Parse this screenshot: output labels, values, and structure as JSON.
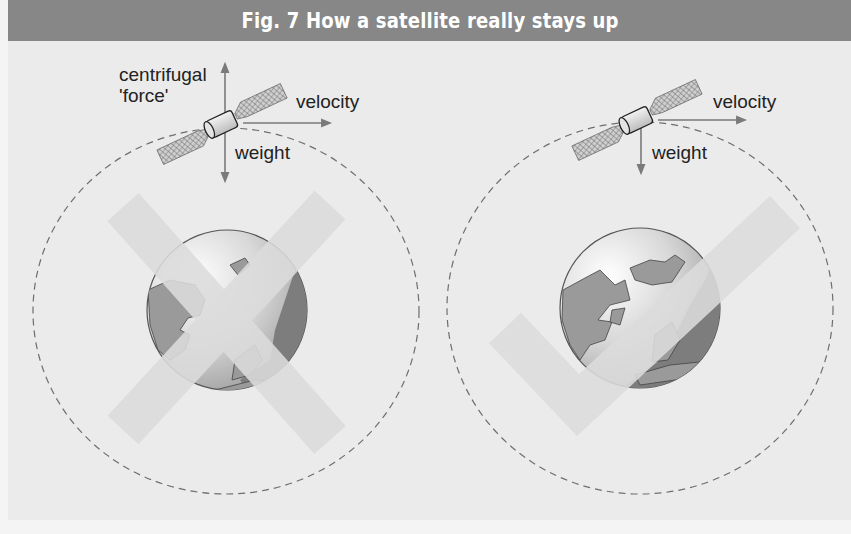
{
  "figure": {
    "title": "Fig. 7 How a satellite really stays up",
    "colors": {
      "header_bg": "#878787",
      "panel_bg": "#ebebeb",
      "mark_color": "#dcdcdc",
      "globe_land": "#9a9a9a",
      "globe_ocean_dark": "#7d7d7d",
      "arrow": "#7a7a7a",
      "orbit_dash": "#6e6e6e"
    }
  },
  "panels": [
    {
      "id": "incorrect",
      "verdict": "wrong",
      "verdict_icon": "cross-mark",
      "labels": {
        "up": "centrifugal",
        "up_line2": "'force'",
        "right": "velocity",
        "down": "weight"
      }
    },
    {
      "id": "correct",
      "verdict": "right",
      "verdict_icon": "check-mark",
      "labels": {
        "right": "velocity",
        "down": "weight"
      }
    }
  ]
}
